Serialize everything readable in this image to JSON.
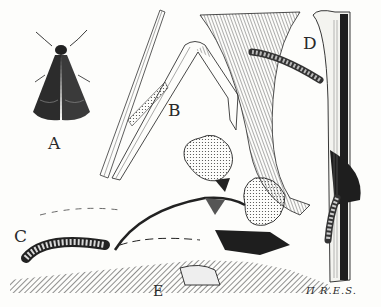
{
  "figure": {
    "labels": {
      "a": "A",
      "b": "B",
      "c": "C",
      "d": "D",
      "e": "E"
    },
    "signature": "R.E.S.",
    "monogram": "Π",
    "colors": {
      "ink": "#1e1e1e",
      "paper": "#fdfdfb"
    }
  }
}
